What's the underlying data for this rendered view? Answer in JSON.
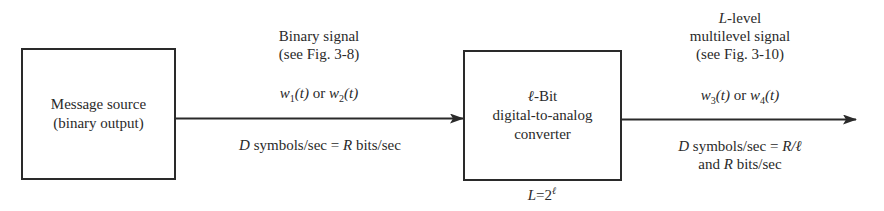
{
  "blocks": {
    "source": {
      "line1": "Message source",
      "line2": "(binary output)"
    },
    "dac": {
      "line1_sym": "ℓ",
      "line1_rest": "-Bit",
      "line2": "digital-to-analog",
      "line3": "converter",
      "below_L": "L",
      "below_eq": "=2",
      "below_exp": "ℓ"
    }
  },
  "link1": {
    "title1": "Binary signal",
    "title2": "(see Fig. 3-8)",
    "w_a": "w",
    "w_a_sub": "1",
    "w_a_arg": "(t)",
    "or": " or ",
    "w_b": "w",
    "w_b_sub": "2",
    "w_b_arg": "(t)",
    "rate_D": "D",
    "rate_mid": " symbols/sec = ",
    "rate_R": "R",
    "rate_end": " bits/sec"
  },
  "link2": {
    "title1_L": "L",
    "title1_rest": "-level",
    "title2": "multilevel signal",
    "title3": "(see Fig. 3-10)",
    "w_a": "w",
    "w_a_sub": "3",
    "w_a_arg": "(t)",
    "or": " or ",
    "w_b": "w",
    "w_b_sub": "4",
    "w_b_arg": "(t)",
    "rate_D": "D",
    "rate_mid": " symbols/sec = ",
    "rate_R": "R/ℓ",
    "rate2_pre": "and ",
    "rate2_R": "R",
    "rate2_end": " bits/sec"
  },
  "colors": {
    "ink": "#2a2a2a",
    "background": "#ffffff"
  }
}
